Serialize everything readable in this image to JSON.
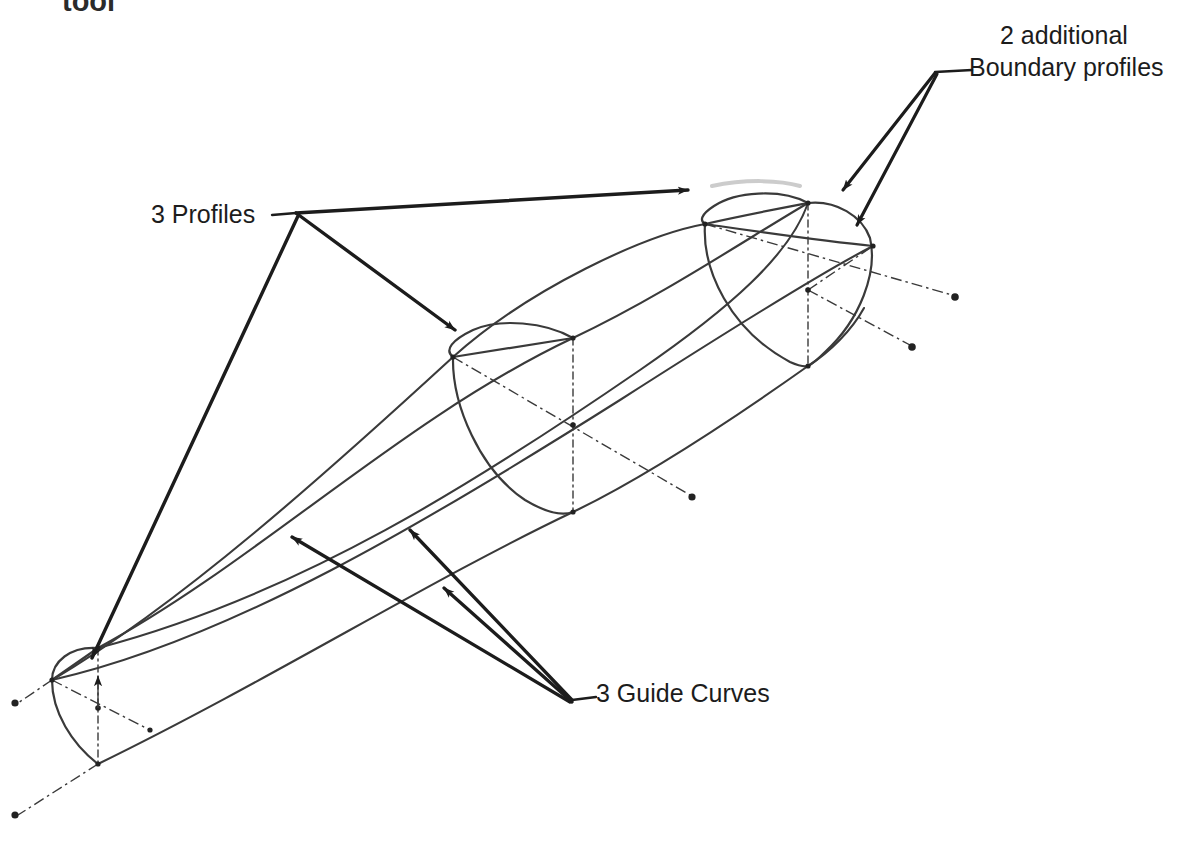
{
  "figure": {
    "title_fragment_top": "tool",
    "background_color": "#ffffff",
    "line_color": "#3a3a3a",
    "annotation_color": "#1c1c1c",
    "width": 1204,
    "height": 849
  },
  "labels": {
    "clipped_top": "tool",
    "boundary_line1": "2 additional",
    "boundary_line2": "Boundary profiles",
    "profiles": "3 Profiles",
    "guide_curves": "3 Guide Curves"
  },
  "diagram": {
    "type": "cad-loft-illustration",
    "profiles": [
      {
        "name": "small-left-profile",
        "size": "small",
        "position": "lower-left"
      },
      {
        "name": "middle-profile",
        "size": "medium",
        "position": "center"
      },
      {
        "name": "large-right-profile",
        "size": "large",
        "position": "upper-right"
      }
    ],
    "guide_curve_count": 3,
    "boundary_profile_count": 2,
    "centerline_style": "dash-dot",
    "centerline_endpoint_marker": "dot"
  }
}
